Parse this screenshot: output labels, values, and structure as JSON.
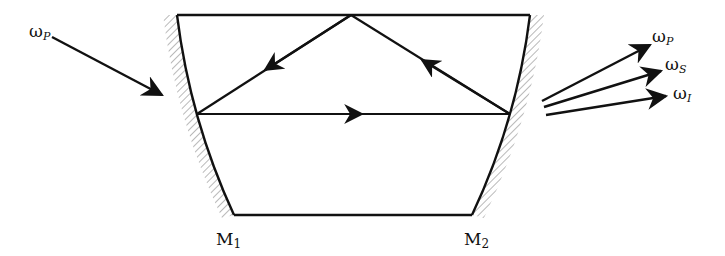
{
  "diagram": {
    "labels": {
      "pump_in": {
        "base": "ω",
        "sub": "P"
      },
      "out_pump": {
        "base": "ω",
        "sub": "P"
      },
      "out_signal": {
        "base": "ω",
        "sub": "S"
      },
      "out_idler": {
        "base": "ω",
        "sub": "I"
      },
      "mirror_left": {
        "base": "M",
        "sub": "1"
      },
      "mirror_right": {
        "base": "M",
        "sub": "2"
      }
    },
    "colors": {
      "line": "#111111",
      "hatch": "#8a8a8a",
      "background": "#ffffff"
    }
  }
}
